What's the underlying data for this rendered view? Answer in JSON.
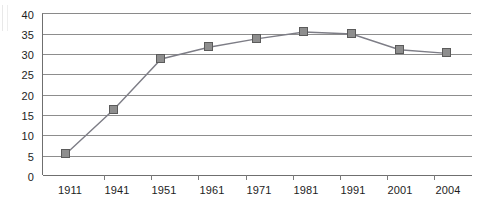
{
  "chart_data": {
    "type": "line",
    "title": "",
    "xlabel": "",
    "ylabel": "",
    "categories": [
      "1911",
      "1941",
      "1951",
      "1961",
      "1971",
      "1981",
      "1991",
      "2001",
      "2004"
    ],
    "values": [
      5.1,
      16.1,
      28.7,
      31.6,
      33.7,
      35.4,
      34.9,
      31.0,
      30.1
    ],
    "ylim": [
      0,
      40
    ],
    "yticks": [
      0,
      5,
      10,
      15,
      20,
      25,
      30,
      35,
      40
    ],
    "ytick_labels": [
      "0",
      "5",
      "10",
      "15",
      "20",
      "25",
      "30",
      "35",
      "40"
    ],
    "grid": "horizontal",
    "legend": "none",
    "series": [
      {
        "name": "series-1",
        "values": [
          5.1,
          16.1,
          28.7,
          31.6,
          33.7,
          35.4,
          34.9,
          31.0,
          30.1
        ],
        "marker": "square",
        "marker_color": "#8e8e8e",
        "marker_border_color": "#5b5b5b",
        "line_color": "#7d7d86"
      }
    ],
    "colors": {
      "line": "#7d7d86",
      "marker_fill": "#8e8e8e",
      "marker_border": "#5b5b5b",
      "gridline": "#8d8d8d",
      "axis": "#6f6f6f",
      "text": "#1d1d1d",
      "background": "#ffffff"
    }
  }
}
